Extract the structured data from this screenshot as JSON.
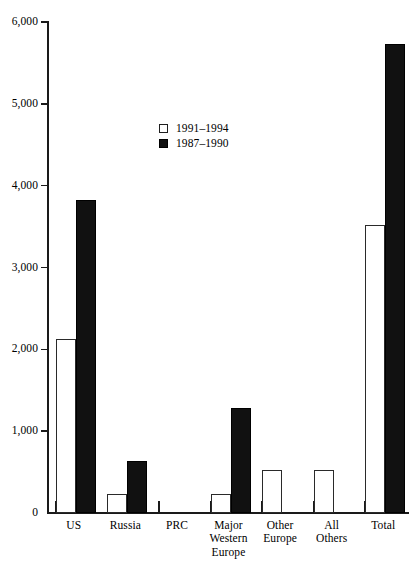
{
  "chart_data": {
    "type": "bar",
    "title": "",
    "subtitle": "",
    "xlabel": "",
    "ylabel": "",
    "ylim": [
      0,
      6000
    ],
    "ytick_values": [
      0,
      1000,
      2000,
      3000,
      4000,
      5000,
      6000
    ],
    "ytick_labels": [
      "0",
      "1,000",
      "2,000",
      "3,000",
      "4,000",
      "5,000",
      "6,000"
    ],
    "grid": false,
    "legend_position": "inside-upper-center",
    "categories": [
      "US",
      "Russia",
      "PRC",
      "Major Western Europe",
      "Other Europe",
      "All Others",
      "Total"
    ],
    "category_label_lines": [
      [
        "US"
      ],
      [
        "Russia"
      ],
      [
        "PRC"
      ],
      [
        "Major",
        "Western",
        "Europe"
      ],
      [
        "Other",
        "Europe"
      ],
      [
        "All",
        "Others"
      ],
      [
        "Total"
      ]
    ],
    "series": [
      {
        "name": "1991–1994",
        "color": "#ffffff",
        "edge_color": "#2a2a2a",
        "values": [
          2130,
          230,
          0,
          230,
          530,
          530,
          3520
        ]
      },
      {
        "name": "1987–1990",
        "color": "#111111",
        "edge_color": "#000000",
        "values": [
          3830,
          630,
          0,
          1280,
          0,
          0,
          5730
        ]
      }
    ]
  },
  "legend": {
    "items": [
      {
        "label": "1991–1994",
        "swatch": "white-square-icon"
      },
      {
        "label": "1987–1990",
        "swatch": "black-square-icon"
      }
    ]
  }
}
